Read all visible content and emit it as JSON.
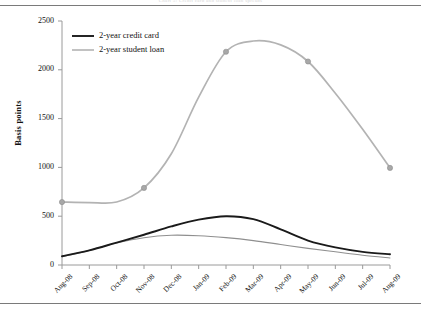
{
  "figure": {
    "background": "#ffffff",
    "top_rule": true,
    "bottom_rule": true,
    "cropped_caption": "Chart 5: Credit card and student loan spreads"
  },
  "chart_data": {
    "type": "line",
    "title": "",
    "xlabel": "",
    "ylabel": "Basis points",
    "categories": [
      "Aug-08",
      "Sep-08",
      "Oct-08",
      "Nov-08",
      "Dec-08",
      "Jan-09",
      "Feb-09",
      "Mar-09",
      "Apr-09",
      "May-09",
      "Jun-09",
      "Jul-09",
      "Aug-09"
    ],
    "ylim": [
      0,
      2500
    ],
    "yticks": [
      0,
      500,
      1000,
      1500,
      2000,
      2500
    ],
    "ytick_labels": [
      "0",
      "500",
      "1000",
      "1500",
      "2000",
      "2500"
    ],
    "grid": false,
    "legend_position": "upper-left-inside",
    "series": [
      {
        "name": "2-year credit card",
        "color": "#1a1a1a",
        "width": 1.9,
        "markers": false,
        "in_legend": true,
        "values": [
          90,
          150,
          230,
          310,
          395,
          465,
          500,
          470,
          365,
          250,
          180,
          135,
          110
        ]
      },
      {
        "name": "2-year student loan",
        "color": "#b3b3b3",
        "width": 1.7,
        "markers": true,
        "marker_months": [
          "Aug-08",
          "Nov-08",
          "Feb-09",
          "May-09",
          "Aug-09"
        ],
        "marker_values": [
          645,
          790,
          2185,
          2085,
          995
        ],
        "in_legend": true,
        "values": [
          645,
          640,
          645,
          790,
          1140,
          1720,
          2185,
          2295,
          2255,
          2085,
          1760,
          1390,
          995
        ]
      },
      {
        "name": "unlabelled lower series",
        "color": "#8f8f8f",
        "width": 1.1,
        "markers": false,
        "in_legend": false,
        "values": [
          85,
          150,
          225,
          280,
          305,
          300,
          280,
          250,
          210,
          170,
          135,
          100,
          72
        ]
      }
    ],
    "legend_entries": [
      {
        "label": "2-year credit card",
        "color": "#1a1a1a"
      },
      {
        "label": "2-year student loan",
        "color": "#b3b3b3"
      }
    ]
  },
  "axes_geometry": {
    "plot_left": 62,
    "plot_right": 390,
    "plot_top": 21,
    "plot_bottom": 265
  }
}
